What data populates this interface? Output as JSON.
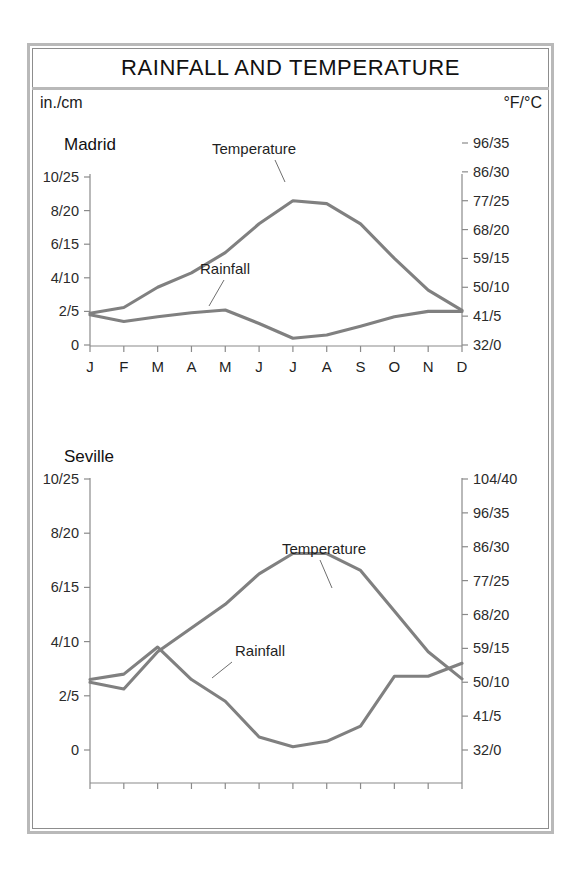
{
  "document": {
    "title": "RAINFALL AND TEMPERATURE",
    "unit_left": "in./cm",
    "unit_right": "°F/°C"
  },
  "style": {
    "line_color": "#808080",
    "axis_color": "#8a8a8a",
    "frame_color": "#b9b9b9",
    "text_color": "#1a1a1a",
    "background": "#ffffff"
  },
  "chart_data": [
    {
      "type": "line",
      "title": "Madrid",
      "xlabel": "",
      "ylabel": "in./cm",
      "y2label": "°F/°C",
      "grid": false,
      "legend": "inline-annotations",
      "categories": [
        "J",
        "F",
        "M",
        "A",
        "M",
        "J",
        "J",
        "A",
        "S",
        "O",
        "N",
        "D"
      ],
      "x_tick_labels": [
        "J",
        "F",
        "M",
        "A",
        "M",
        "J",
        "J",
        "A",
        "S",
        "O",
        "N",
        "D"
      ],
      "y_tick_labels": [
        "10/25",
        "8/20",
        "6/15",
        "4/10",
        "2/5",
        "0"
      ],
      "y_tick_values": [
        25,
        20,
        15,
        10,
        5,
        0
      ],
      "ylim": [
        0,
        25
      ],
      "y2_tick_labels": [
        "96/35",
        "86/30",
        "77/25",
        "68/20",
        "59/15",
        "50/10",
        "41/5",
        "32/0"
      ],
      "y2_tick_values": [
        35,
        30,
        25,
        20,
        15,
        10,
        5,
        0
      ],
      "y2lim": [
        0,
        35
      ],
      "series": [
        {
          "name": "Temperature",
          "unit": "°C",
          "axis": "right",
          "values": [
            5.5,
            6.5,
            10,
            12.5,
            16,
            21,
            25,
            24.5,
            21,
            15,
            9.5,
            6
          ]
        },
        {
          "name": "Rainfall",
          "unit": "cm",
          "axis": "left",
          "values": [
            4.5,
            3.5,
            4.2,
            4.8,
            5.2,
            3.2,
            1.0,
            1.5,
            2.8,
            4.2,
            5.0,
            5.0
          ]
        }
      ]
    },
    {
      "type": "line",
      "title": "Seville",
      "xlabel": "",
      "ylabel": "in./cm",
      "y2label": "°F/°C",
      "grid": false,
      "legend": "inline-annotations",
      "categories": [
        "J",
        "F",
        "M",
        "A",
        "M",
        "J",
        "J",
        "A",
        "S",
        "O",
        "N",
        "D"
      ],
      "x_tick_labels": [
        "",
        "",
        "",
        "",
        "",
        "",
        "",
        "",
        "",
        "",
        "",
        ""
      ],
      "y_tick_labels": [
        "10/25",
        "8/20",
        "6/15",
        "4/10",
        "2/5",
        "0"
      ],
      "y_tick_values": [
        25,
        20,
        15,
        10,
        5,
        0
      ],
      "ylim": [
        0,
        25
      ],
      "y2_tick_labels": [
        "104/40",
        "96/35",
        "86/30",
        "77/25",
        "68/20",
        "59/15",
        "50/10",
        "41/5",
        "32/0"
      ],
      "y2_tick_values": [
        40,
        35,
        30,
        25,
        20,
        15,
        10,
        5,
        0
      ],
      "y2lim": [
        0,
        40
      ],
      "series": [
        {
          "name": "Temperature",
          "unit": "°C",
          "axis": "right",
          "values": [
            10,
            9,
            14.5,
            18,
            21.5,
            26,
            29,
            29,
            26.5,
            20.5,
            14.5,
            10.5
          ]
        },
        {
          "name": "Rainfall",
          "unit": "cm",
          "axis": "left",
          "values": [
            6.5,
            7.0,
            9.5,
            6.5,
            4.5,
            1.2,
            0.3,
            0.8,
            2.2,
            6.8,
            6.8,
            8.0
          ]
        }
      ]
    }
  ],
  "annotations": {
    "madrid": {
      "temperature": "Temperature",
      "rainfall": "Rainfall"
    },
    "seville": {
      "temperature": "Temperature",
      "rainfall": "Rainfall"
    }
  }
}
